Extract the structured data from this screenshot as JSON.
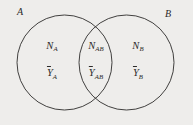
{
  "figure": {
    "type": "venn-diagram-2-set",
    "background_color": "#eeedeb",
    "stroke_color": "#2e2c2b"
  },
  "sets": {
    "left": {
      "label": "A"
    },
    "right": {
      "label": "B"
    }
  },
  "regions": [
    {
      "key": "a_only",
      "count_symbol": "N",
      "count_subscript": "A",
      "mean_symbol": "Y",
      "mean_subscript": "A"
    },
    {
      "key": "intersection",
      "count_symbol": "N",
      "count_subscript": "AB",
      "mean_symbol": "Y",
      "mean_subscript": "AB"
    },
    {
      "key": "b_only",
      "count_symbol": "N",
      "count_subscript": "B",
      "mean_symbol": "Y",
      "mean_subscript": "B"
    }
  ]
}
